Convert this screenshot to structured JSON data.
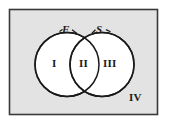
{
  "figure": {
    "kind": "venn-diagram",
    "universe": {
      "region_label": "IV",
      "fill_color": "#e3e3e3",
      "border_color": "#3a3a3a"
    },
    "circles": [
      {
        "name": "left-circle",
        "set_label": "F",
        "region_label": "I",
        "fill_color": "#ffffff",
        "stroke_color": "#1a1a1a"
      },
      {
        "name": "right-circle",
        "set_label": "S",
        "region_label": "III",
        "fill_color": "#ffffff",
        "stroke_color": "#1a1a1a"
      }
    ],
    "intersection": {
      "name": "intersection",
      "region_label": "II",
      "fill_color": "#ffffff"
    }
  }
}
